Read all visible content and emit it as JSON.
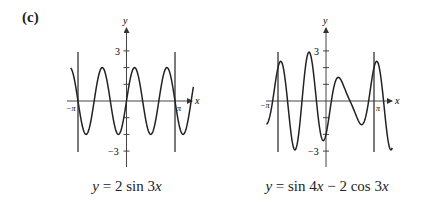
{
  "figure": {
    "part_label": "(c)"
  },
  "chart_data": [
    {
      "type": "line",
      "title": "",
      "caption": "y = 2 sin 3x",
      "function": "2*sin(3x)",
      "xlabel": "x",
      "ylabel": "y",
      "x_tick_labels": [
        "−π",
        "π"
      ],
      "y_tick_labels": [
        "3",
        "−3"
      ],
      "y_ticks": [
        -3,
        -2,
        -1,
        1,
        2,
        3
      ],
      "ylim": [
        -4,
        4.5
      ],
      "xlim_plotted": [
        -1.15,
        1.38
      ],
      "x_units": "multiples of pi",
      "vertical_lines_at": [
        -1,
        1
      ],
      "grid": false,
      "sample_points": {
        "x": [
          -1.0,
          -0.8333,
          -0.6667,
          -0.5,
          -0.3333,
          -0.1667,
          0.0,
          0.1667,
          0.3333,
          0.5,
          0.6667,
          0.8333,
          1.0
        ],
        "y": [
          0,
          -2,
          0,
          2,
          0,
          -2,
          0,
          2,
          0,
          -2,
          0,
          2,
          0
        ]
      }
    },
    {
      "type": "line",
      "title": "",
      "caption": "y = sin 4x − 2 cos 3x",
      "function": "sin(4x) - 2*cos(3x)",
      "xlabel": "x",
      "ylabel": "y",
      "x_tick_labels": [
        "−π",
        "π"
      ],
      "y_tick_labels": [
        "3",
        "−3"
      ],
      "y_ticks": [
        -3,
        -2,
        -1,
        1,
        2,
        3
      ],
      "ylim": [
        -4,
        4.5
      ],
      "xlim_plotted": [
        -1.24,
        1.38
      ],
      "x_units": "multiples of pi",
      "vertical_lines_at": [
        -1,
        1
      ],
      "grid": false,
      "sample_points": {
        "x": [
          -1.0,
          -0.9,
          -0.6,
          -0.3,
          0.0,
          0.2,
          0.4,
          0.7,
          0.9,
          1.0
        ],
        "y": [
          2.0,
          2.3,
          -2.95,
          2.95,
          -2.0,
          1.3,
          0.3,
          -1.5,
          2.3,
          2.0
        ]
      }
    }
  ],
  "captions": {
    "left": {
      "lhs": "y",
      "rhs": "2 sin 3",
      "var": "x"
    },
    "right": {
      "lhs": "y",
      "rhs_a": "sin 4",
      "var_a": "x",
      "minus": "−",
      "rhs_b": "2 cos 3",
      "var_b": "x"
    }
  },
  "axis_labels": {
    "x": "x",
    "y": "y",
    "neg_pi": "−π",
    "pi": "π",
    "three": "3",
    "neg_three": "−3"
  }
}
